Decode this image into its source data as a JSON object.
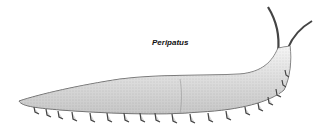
{
  "illustration": {
    "caption": "Peripatus",
    "subject": "velvet-worm-drawing",
    "colors": {
      "background": "#ffffff",
      "ink": "#333333",
      "body_fill": "#e6e6e6"
    }
  }
}
